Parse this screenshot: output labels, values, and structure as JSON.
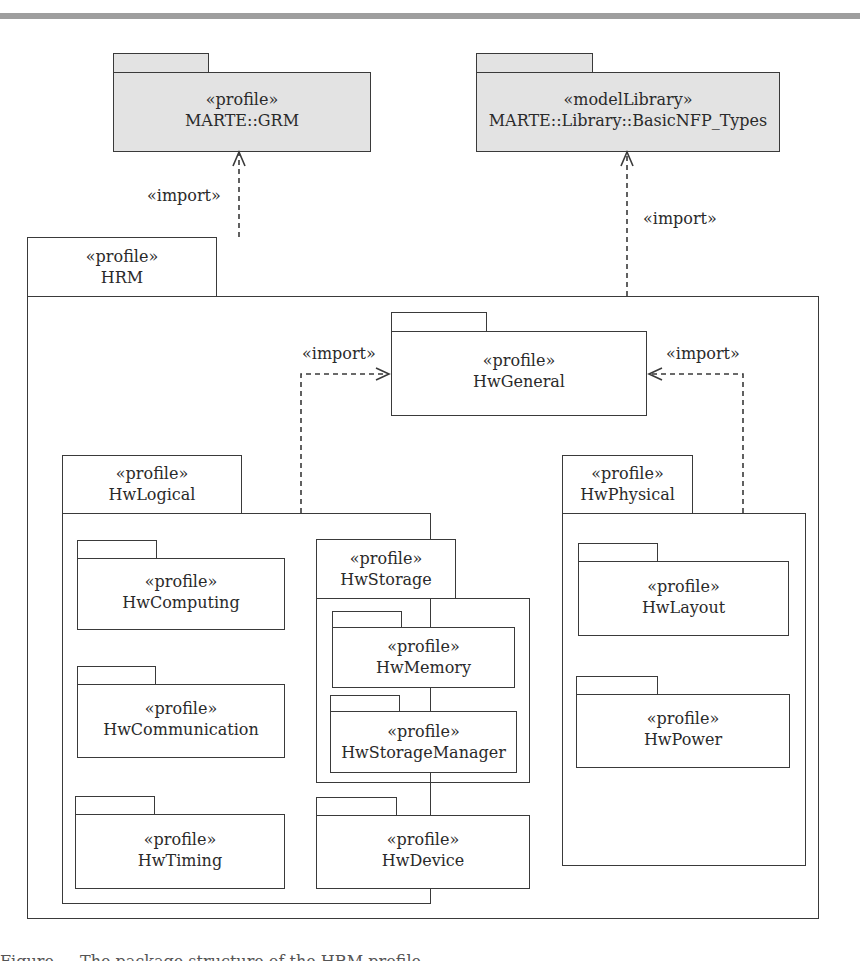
{
  "diagram": {
    "type": "UML package diagram",
    "top_packages": [
      {
        "id": "grm",
        "stereotype": "«profile»",
        "name": "MARTE::GRM",
        "fill": "#e3e3e3"
      },
      {
        "id": "nfp",
        "stereotype": "«modelLibrary»",
        "name": "MARTE::Library::BasicNFP_Types",
        "fill": "#e3e3e3"
      }
    ],
    "hrm": {
      "stereotype": "«profile»",
      "name": "HRM"
    },
    "hwgeneral": {
      "stereotype": "«profile»",
      "name": "HwGeneral"
    },
    "hwlogical": {
      "stereotype": "«profile»",
      "name": "HwLogical",
      "children": [
        {
          "stereotype": "«profile»",
          "name": "HwComputing"
        },
        {
          "stereotype": "«profile»",
          "name": "HwCommunication"
        },
        {
          "stereotype": "«profile»",
          "name": "HwTiming"
        },
        {
          "stereotype": "«profile»",
          "name": "HwDevice"
        }
      ],
      "hwstorage": {
        "stereotype": "«profile»",
        "name": "HwStorage",
        "children": [
          {
            "stereotype": "«profile»",
            "name": "HwMemory"
          },
          {
            "stereotype": "«profile»",
            "name": "HwStorageManager"
          }
        ]
      }
    },
    "hwphysical": {
      "stereotype": "«profile»",
      "name": "HwPhysical",
      "children": [
        {
          "stereotype": "«profile»",
          "name": "HwLayout"
        },
        {
          "stereotype": "«profile»",
          "name": "HwPower"
        }
      ]
    },
    "dependencies": [
      {
        "from": "HRM",
        "to": "MARTE::GRM",
        "label": "«import»"
      },
      {
        "from": "HRM",
        "to": "MARTE::Library::BasicNFP_Types",
        "label": "«import»"
      },
      {
        "from": "HwLogical",
        "to": "HwGeneral",
        "label": "«import»"
      },
      {
        "from": "HwPhysical",
        "to": "HwGeneral",
        "label": "«import»"
      }
    ],
    "caption": "Figure — The package structure of the HRM profile"
  }
}
